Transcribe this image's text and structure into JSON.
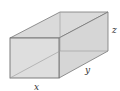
{
  "diagram": {
    "type": "rectangular-box",
    "labels": {
      "x": "x",
      "y": "y",
      "z": "z"
    },
    "colors": {
      "face_fill": "#dcdcdc",
      "edge_stroke": "#777777",
      "hidden_edge": "#9a9a9a",
      "label": "#333333"
    }
  }
}
